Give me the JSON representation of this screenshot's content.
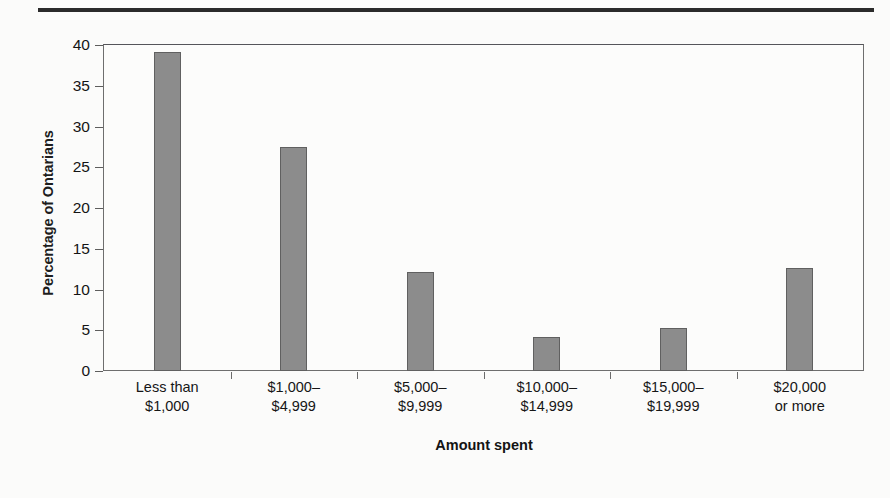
{
  "figure": {
    "top_rule": "horizontal-rule",
    "background_color": "#fbfbfa",
    "bar_color": "#8c8c8c",
    "bar_edge_color": "#606060",
    "frame_color": "#6e6e6e"
  },
  "chart_data": {
    "type": "bar",
    "title": "",
    "xlabel": "Amount spent",
    "ylabel": "Percentage of Ontarians",
    "categories": [
      "Less than $1,000",
      "$1,000–$4,999",
      "$5,000–$9,999",
      "$10,000–$14,999",
      "$15,000–$19,999",
      "$20,000 or more"
    ],
    "category_lines": [
      [
        "Less than",
        "$1,000"
      ],
      [
        "$1,000–",
        "$4,999"
      ],
      [
        "$5,000–",
        "$9,999"
      ],
      [
        "$10,000–",
        "$14,999"
      ],
      [
        "$15,000–",
        "$19,999"
      ],
      [
        "$20,000",
        "or more"
      ]
    ],
    "values": [
      39.1,
      27.5,
      12.2,
      4.2,
      5.3,
      12.7
    ],
    "ylim": [
      0,
      40
    ],
    "ytick_values": [
      0,
      5,
      10,
      15,
      20,
      25,
      30,
      35,
      40
    ],
    "ytick_labels": [
      "0",
      "5",
      "10",
      "15",
      "20",
      "25",
      "30",
      "35",
      "40"
    ],
    "grid": false,
    "legend": null
  }
}
